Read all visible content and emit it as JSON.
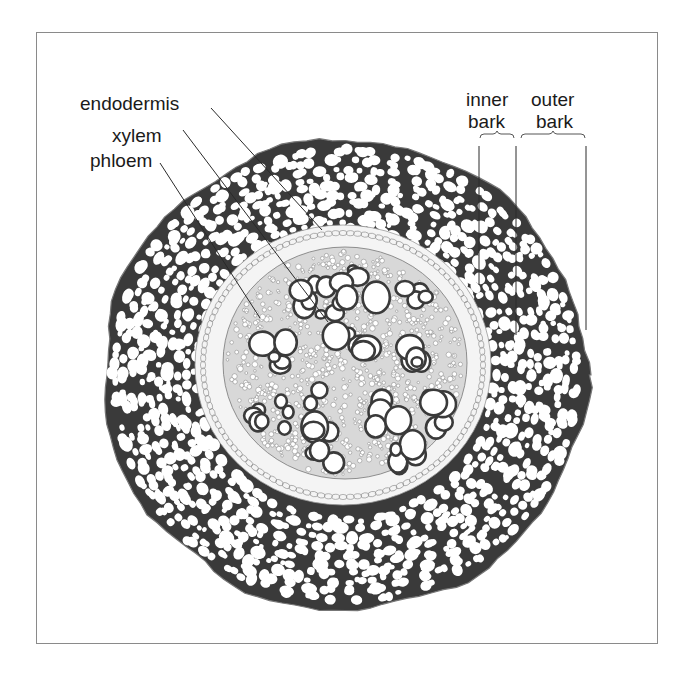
{
  "diagram": {
    "labels": {
      "endodermis": "endodermis",
      "xylem": "xylem",
      "phloem": "phloem",
      "inner_bark_line1": "inner",
      "inner_bark_line2": "bark",
      "outer_bark_line1": "outer",
      "outer_bark_line2": "bark"
    },
    "regions": [
      "outer bark",
      "inner bark",
      "endodermis",
      "phloem",
      "xylem"
    ],
    "colors": {
      "tissue_dark": "#3a3a3a",
      "cell_fill": "#ffffff",
      "endodermis_band": "#f4f4f4",
      "leader_line": "#2a2a2a",
      "frame": "#8a8a8a"
    }
  }
}
